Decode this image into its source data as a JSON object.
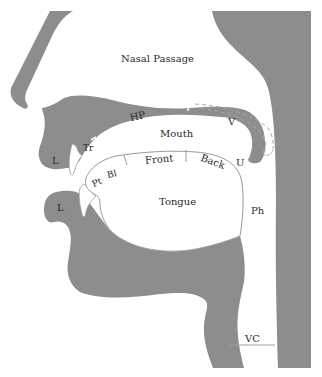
{
  "diagram": {
    "fill_color": "#8d8d8d",
    "labels": {
      "nasal_passage": "Nasal Passage",
      "hard_palate": "HP",
      "velum": "V",
      "mouth": "Mouth",
      "teeth_ridge": "Tr",
      "upper_lip": "L",
      "lower_lip": "L",
      "uvula": "U",
      "tip": "Pt",
      "blade": "Bl",
      "front": "Front",
      "back": "Back",
      "tongue": "Tongue",
      "pharynx": "Ph",
      "vocal_cords": "VC"
    }
  }
}
